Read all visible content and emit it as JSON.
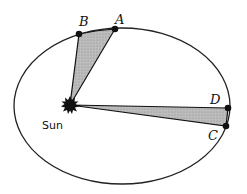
{
  "diagram": {
    "type": "kepler-second-law",
    "orbit": {
      "cx": 122,
      "cy": 106,
      "rx": 108,
      "ry": 78,
      "stroke": "#222222"
    },
    "sun": {
      "label": "Sun",
      "x": 70,
      "y": 105
    },
    "points": {
      "A": {
        "label": "A",
        "x": 115,
        "y": 29
      },
      "B": {
        "label": "B",
        "x": 79,
        "y": 34
      },
      "C": {
        "label": "C",
        "x": 226,
        "y": 126
      },
      "D": {
        "label": "D",
        "x": 228,
        "y": 108
      }
    },
    "sectors": [
      {
        "name": "sector-AB",
        "from": "B",
        "to": "A"
      },
      {
        "name": "sector-CD",
        "from": "D",
        "to": "C"
      }
    ],
    "colors": {
      "fill": "#b3b3b3",
      "line": "#111111",
      "background": "#ffffff"
    }
  }
}
